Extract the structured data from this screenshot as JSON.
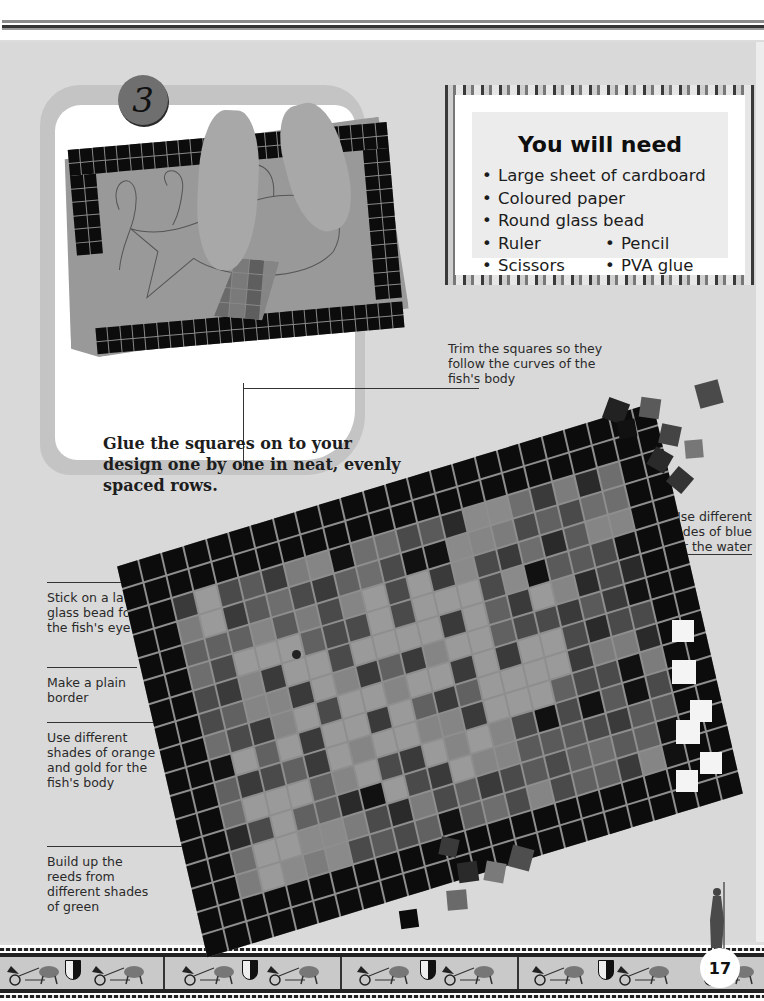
{
  "page": {
    "page_number": "17",
    "palette": {
      "page_bg": "#d9d9d9",
      "panel_bg": "#ffffff",
      "tile_black": "#0c0c0c",
      "grout": "#8e8e8e",
      "text": "#1a1a1a"
    }
  },
  "step": {
    "number": "3",
    "caption": "Glue the squares on to your design one by one in neat, evenly spaced rows."
  },
  "you_will_need": {
    "title": "You will need",
    "items": [
      "Large sheet of cardboard",
      "Coloured paper",
      "Round glass bead"
    ],
    "two_column_items": [
      [
        "Ruler",
        "Pencil"
      ],
      [
        "Scissors",
        "PVA glue"
      ]
    ]
  },
  "annotations": {
    "trim": "Trim the squares so they follow the curves of the fish's body",
    "water": "Use different shades of blue for the water",
    "eye": "Stick on a large glass bead for the fish's eye",
    "border": "Make a plain border",
    "body": "Use different shades of orange and gold for the fish's body",
    "reeds": "Build up the reeds from different shades of green"
  },
  "mosaic": {
    "cols": 24,
    "rows": 17,
    "border_width": 2,
    "shades": [
      "#5a5a5a",
      "#6e6e6e",
      "#7c7c7c",
      "#4a4a4a",
      "#3a3a3a",
      "#858585",
      "#616161",
      "#2a2a2a"
    ],
    "fish_shade": "#9a9a9a",
    "reed_shade": "#8a8a8a"
  },
  "icons": {
    "step_badge": "number-badge-icon",
    "page_number": "page-number-badge",
    "statue": "athena-statue-icon",
    "frieze": "chariot-frieze-decoration",
    "shield": "cross-shield-icon"
  }
}
